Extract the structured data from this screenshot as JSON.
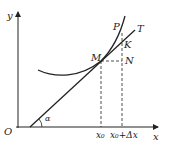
{
  "diagram": {
    "labels": {
      "y_axis": "y",
      "x_axis": "x",
      "origin": "O",
      "angle": "α",
      "point_M": "M",
      "point_N": "N",
      "point_K": "K",
      "point_P": "P",
      "tangent": "T",
      "x0": "x₀",
      "x0_dx": "x₀+Δx"
    },
    "colors": {
      "stroke": "#222222",
      "background": "#ffffff"
    }
  }
}
